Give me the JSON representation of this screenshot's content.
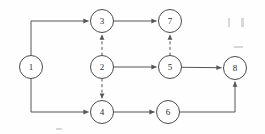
{
  "diagram": {
    "type": "directed-graph",
    "canvas": {
      "width": 265,
      "height": 134
    },
    "node_radius": 11.5,
    "colors": {
      "background": "#fefefe",
      "node_fill": "#ffffff",
      "node_stroke": "#4a4a4a",
      "edge_stroke": "#555555",
      "label": "#2b2b2b"
    },
    "nodes": [
      {
        "id": "1",
        "label": "1",
        "x": 31,
        "y": 67
      },
      {
        "id": "2",
        "label": "2",
        "x": 102,
        "y": 67
      },
      {
        "id": "3",
        "label": "3",
        "x": 102,
        "y": 21
      },
      {
        "id": "4",
        "label": "4",
        "x": 102,
        "y": 112
      },
      {
        "id": "5",
        "label": "5",
        "x": 170,
        "y": 67
      },
      {
        "id": "6",
        "label": "6",
        "x": 168,
        "y": 112
      },
      {
        "id": "7",
        "label": "7",
        "x": 170,
        "y": 21
      },
      {
        "id": "8",
        "label": "8",
        "x": 235,
        "y": 68
      }
    ],
    "edges": [
      {
        "id": "e-1-3",
        "from": "1",
        "to": "3",
        "style": "solid",
        "routing": "elbow-up",
        "arrow": true
      },
      {
        "id": "e-1-4",
        "from": "1",
        "to": "4",
        "style": "solid",
        "routing": "elbow-down",
        "arrow": true
      },
      {
        "id": "e-3-7",
        "from": "3",
        "to": "7",
        "style": "solid",
        "routing": "horizontal",
        "arrow": true
      },
      {
        "id": "e-2-3",
        "from": "2",
        "to": "3",
        "style": "dashed",
        "routing": "vertical-up",
        "arrow": true
      },
      {
        "id": "e-2-4",
        "from": "2",
        "to": "4",
        "style": "dashed",
        "routing": "vertical-down",
        "arrow": true
      },
      {
        "id": "e-2-5",
        "from": "2",
        "to": "5",
        "style": "solid",
        "routing": "horizontal",
        "arrow": true
      },
      {
        "id": "e-5-7",
        "from": "5",
        "to": "7",
        "style": "dashed",
        "routing": "vertical-up",
        "arrow": true
      },
      {
        "id": "e-5-8",
        "from": "5",
        "to": "8",
        "style": "solid",
        "routing": "horizontal",
        "arrow": true
      },
      {
        "id": "e-4-6",
        "from": "4",
        "to": "6",
        "style": "solid",
        "routing": "horizontal",
        "arrow": true
      },
      {
        "id": "e-6-8",
        "from": "6",
        "to": "8",
        "style": "solid",
        "routing": "elbow-right-up",
        "arrow": true
      }
    ],
    "paths": {
      "e-1-3": "M 31 55.5 L 31 21 L 88.6 21",
      "e-1-4": "M 31 78.5 L 31 112 L 88.6 112",
      "e-3-7": "M 113.5 21 L 156.6 21",
      "e-2-3": "M 102 55.5 L 102 34.6",
      "e-2-4": "M 102 78.5 L 102 98.6",
      "e-2-5": "M 113.5 67 L 156.6 67",
      "e-5-7": "M 170 55.5 L 170 34.6",
      "e-5-8": "M 181.5 67.3 L 221.6 67.7",
      "e-4-6": "M 113.5 112 L 154.6 112",
      "e-6-8": "M 179.5 112 L 235 112 L 235 81.6"
    },
    "arrowheads": [
      {
        "for": "e-1-3",
        "x": 88.6,
        "y": 21,
        "angle": 0
      },
      {
        "for": "e-1-4",
        "x": 88.6,
        "y": 112,
        "angle": 0
      },
      {
        "for": "e-3-7",
        "x": 156.6,
        "y": 21,
        "angle": 0
      },
      {
        "for": "e-2-3",
        "x": 102,
        "y": 34.6,
        "angle": -90
      },
      {
        "for": "e-2-4",
        "x": 102,
        "y": 98.6,
        "angle": 90
      },
      {
        "for": "e-2-5",
        "x": 156.6,
        "y": 67,
        "angle": 0
      },
      {
        "for": "e-5-7",
        "x": 170,
        "y": 34.6,
        "angle": -90
      },
      {
        "for": "e-5-8",
        "x": 221.6,
        "y": 67.7,
        "angle": 0
      },
      {
        "for": "e-4-6",
        "x": 154.6,
        "y": 112,
        "angle": 0
      },
      {
        "for": "e-6-8",
        "x": 235,
        "y": 81.6,
        "angle": -90
      }
    ],
    "specks": [
      {
        "x": 228,
        "y": 18,
        "w": 2,
        "h": 9
      },
      {
        "x": 241,
        "y": 18,
        "w": 3,
        "h": 9
      },
      {
        "x": 234,
        "y": 46,
        "w": 9,
        "h": 2
      },
      {
        "x": 56,
        "y": 128,
        "w": 6,
        "h": 2
      }
    ]
  }
}
